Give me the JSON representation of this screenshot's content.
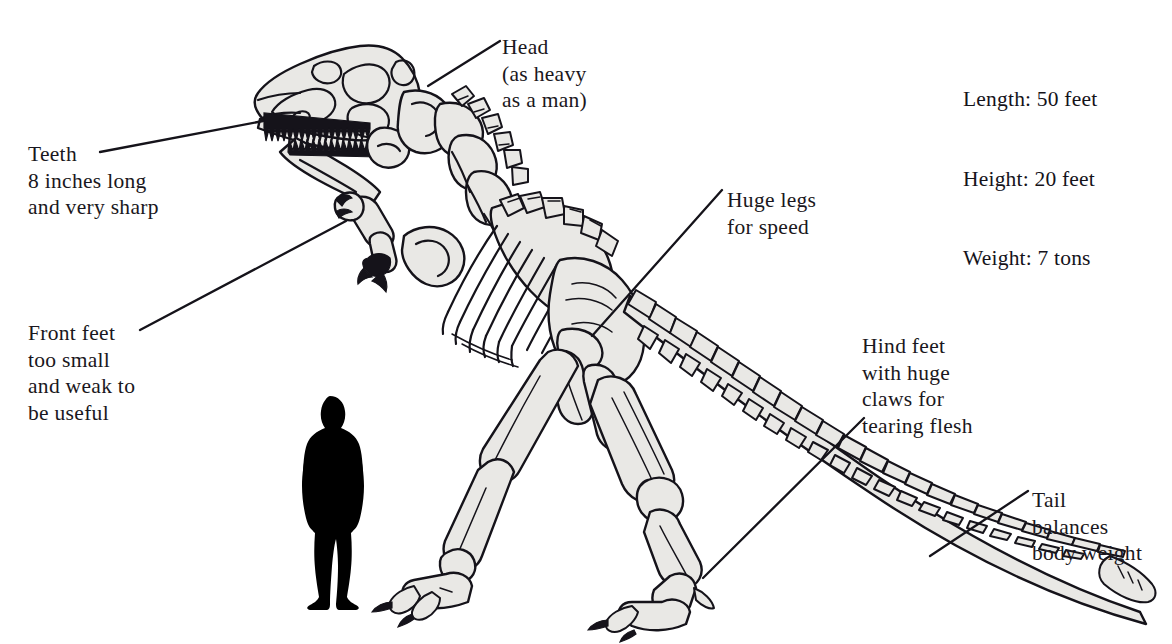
{
  "figure": {
    "background_color": "#ffffff",
    "ink_color": "#15131a",
    "bone_fill_color": "#e9e8e5",
    "human_silhouette_color": "#000000"
  },
  "stats": {
    "length": "Length: 50 feet",
    "height": "Height: 20 feet",
    "weight": "Weight: 7 tons"
  },
  "labels": {
    "teeth": "Teeth\n8 inches long\nand very sharp",
    "front_feet": "Front feet\ntoo small\nand weak to\nbe useful",
    "head": "Head\n(as heavy\nas a man)",
    "huge_legs": "Huge legs\nfor speed",
    "hind_feet": "Hind feet\nwith huge\nclaws for\ntearing flesh",
    "tail": "Tail\nbalances\nbody weight"
  },
  "leader_lines": [
    {
      "name": "teeth-leader",
      "from": [
        100,
        152
      ],
      "to": [
        263,
        121
      ]
    },
    {
      "name": "front-feet-leader",
      "from": [
        140,
        330
      ],
      "to": [
        346,
        221
      ]
    },
    {
      "name": "head-leader",
      "from": [
        428,
        86
      ],
      "to": [
        500,
        41
      ]
    },
    {
      "name": "huge-legs-leader",
      "from": [
        592,
        336
      ],
      "to": [
        722,
        190
      ]
    },
    {
      "name": "hind-feet-leader",
      "from": [
        703,
        578
      ],
      "to": [
        864,
        418
      ]
    },
    {
      "name": "tail-leader",
      "from": [
        930,
        556
      ],
      "to": [
        1028,
        491
      ]
    }
  ]
}
